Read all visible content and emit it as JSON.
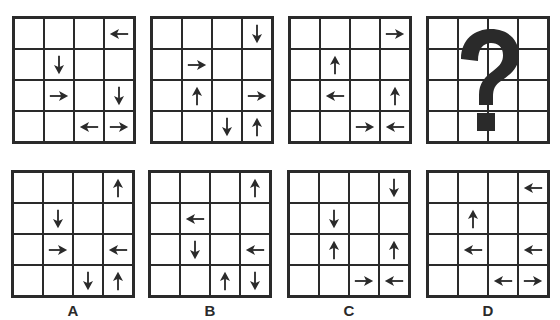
{
  "puzzle": {
    "question_grids": [
      {
        "id": "q1",
        "arrows": [
          {
            "row": 0,
            "col": 3,
            "dir": "left"
          },
          {
            "row": 1,
            "col": 1,
            "dir": "down"
          },
          {
            "row": 2,
            "col": 1,
            "dir": "right"
          },
          {
            "row": 2,
            "col": 3,
            "dir": "down"
          },
          {
            "row": 3,
            "col": 2,
            "dir": "left"
          },
          {
            "row": 3,
            "col": 3,
            "dir": "right"
          }
        ]
      },
      {
        "id": "q2",
        "arrows": [
          {
            "row": 0,
            "col": 3,
            "dir": "down"
          },
          {
            "row": 1,
            "col": 1,
            "dir": "right"
          },
          {
            "row": 2,
            "col": 1,
            "dir": "up"
          },
          {
            "row": 2,
            "col": 3,
            "dir": "right"
          },
          {
            "row": 3,
            "col": 2,
            "dir": "down"
          },
          {
            "row": 3,
            "col": 3,
            "dir": "up"
          }
        ]
      },
      {
        "id": "q3",
        "arrows": [
          {
            "row": 0,
            "col": 3,
            "dir": "right"
          },
          {
            "row": 1,
            "col": 1,
            "dir": "up"
          },
          {
            "row": 2,
            "col": 1,
            "dir": "left"
          },
          {
            "row": 2,
            "col": 3,
            "dir": "up"
          },
          {
            "row": 3,
            "col": 2,
            "dir": "right"
          },
          {
            "row": 3,
            "col": 3,
            "dir": "left"
          }
        ]
      },
      {
        "id": "q4",
        "unknown": true,
        "symbol": "?",
        "arrows": []
      }
    ],
    "answer_options": [
      {
        "label": "A",
        "arrows": [
          {
            "row": 0,
            "col": 3,
            "dir": "up"
          },
          {
            "row": 1,
            "col": 1,
            "dir": "down"
          },
          {
            "row": 2,
            "col": 1,
            "dir": "right"
          },
          {
            "row": 2,
            "col": 3,
            "dir": "left"
          },
          {
            "row": 3,
            "col": 2,
            "dir": "down"
          },
          {
            "row": 3,
            "col": 3,
            "dir": "up"
          }
        ]
      },
      {
        "label": "B",
        "arrows": [
          {
            "row": 0,
            "col": 3,
            "dir": "up"
          },
          {
            "row": 1,
            "col": 1,
            "dir": "left"
          },
          {
            "row": 2,
            "col": 1,
            "dir": "down"
          },
          {
            "row": 2,
            "col": 3,
            "dir": "left"
          },
          {
            "row": 3,
            "col": 2,
            "dir": "up"
          },
          {
            "row": 3,
            "col": 3,
            "dir": "down"
          }
        ]
      },
      {
        "label": "C",
        "arrows": [
          {
            "row": 0,
            "col": 3,
            "dir": "down"
          },
          {
            "row": 1,
            "col": 1,
            "dir": "down"
          },
          {
            "row": 2,
            "col": 1,
            "dir": "up"
          },
          {
            "row": 2,
            "col": 3,
            "dir": "up"
          },
          {
            "row": 3,
            "col": 2,
            "dir": "right"
          },
          {
            "row": 3,
            "col": 3,
            "dir": "left"
          }
        ]
      },
      {
        "label": "D",
        "arrows": [
          {
            "row": 0,
            "col": 3,
            "dir": "left"
          },
          {
            "row": 1,
            "col": 1,
            "dir": "up"
          },
          {
            "row": 2,
            "col": 1,
            "dir": "left"
          },
          {
            "row": 2,
            "col": 3,
            "dir": "left"
          },
          {
            "row": 3,
            "col": 2,
            "dir": "left"
          },
          {
            "row": 3,
            "col": 3,
            "dir": "right"
          }
        ]
      }
    ],
    "grid_size": 4,
    "colors": {
      "line": "#2a2a2a",
      "arrow": "#2a2a2a",
      "background": "#ffffff"
    },
    "layout": {
      "question_positions": [
        [
          12,
          16
        ],
        [
          150,
          16
        ],
        [
          288,
          16
        ],
        [
          426,
          16
        ]
      ],
      "option_positions": [
        [
          11,
          170
        ],
        [
          148,
          170
        ],
        [
          287,
          170
        ],
        [
          426,
          170
        ]
      ]
    }
  }
}
